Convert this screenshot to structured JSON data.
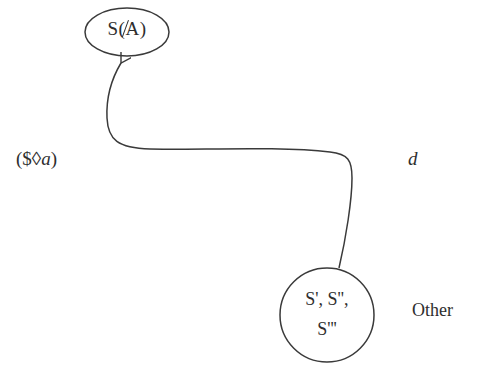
{
  "diagram": {
    "type": "state-transition",
    "nodes": [
      {
        "id": "top",
        "shape": "ellipse",
        "label_prefix": "S(",
        "label_symbol": "A",
        "label_suffix": ")",
        "label_full": "S(A̸)"
      },
      {
        "id": "bottom",
        "shape": "circle",
        "label_line1": "S', S'',",
        "label_line2": "S'''"
      }
    ],
    "edges": [
      {
        "from": "bottom",
        "to": "top",
        "style": "curved-arrow"
      }
    ],
    "annotations": {
      "left_open": "(",
      "left_symbol": "$",
      "left_diamond": "◊",
      "left_var": "a",
      "left_close": ")",
      "right": "d",
      "other": "Other"
    },
    "colors": {
      "stroke": "#3a3a3a",
      "text": "#2e2e2e",
      "background": "#ffffff"
    }
  }
}
